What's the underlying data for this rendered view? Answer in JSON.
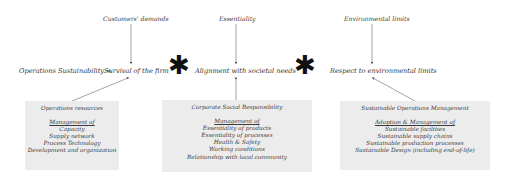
{
  "top_labels": {
    "customers": "Customers' demands",
    "essentiality": "Essentiality",
    "environmental": "Environmental limits"
  },
  "equation": {
    "lhs": "Operations Sustainability =",
    "term1": "Survival of the firm",
    "op1": "✱",
    "term2": "Alignment with societal needs",
    "op2": "✱",
    "term3": "Respect to environmental limits"
  },
  "boxes": [
    {
      "title": "Operations resources",
      "subtitle": "Management of",
      "items": [
        "Capacity",
        "Supply network",
        "Process Technology",
        "Development and organization"
      ]
    },
    {
      "title": "Corporate Social Responsibility",
      "subtitle": "Management of",
      "items": [
        "Essentiality of products",
        "Essentiality of processes",
        "Health & Safety",
        "Working conditions",
        "Relationship with local community"
      ]
    },
    {
      "title": "Sustainable Operations  Management",
      "subtitle": "Adoption  & Management of",
      "items": [
        "Sustainable  facilities",
        "Sustainable supply chains",
        "Sustainable production processes",
        "Sustainable Design (including end-of-life)"
      ]
    }
  ],
  "colors": {
    "box_fill": "#ececec",
    "arrow": "#555555",
    "text": "#333333"
  }
}
